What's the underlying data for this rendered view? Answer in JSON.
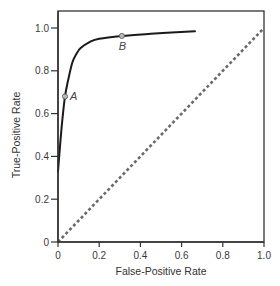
{
  "chart_data": {
    "type": "line",
    "title": "",
    "xlabel": "False-Positive Rate",
    "ylabel": "True-Positive Rate",
    "xlim": [
      0,
      1.0
    ],
    "ylim": [
      0,
      1.0
    ],
    "grid": false,
    "legend": "none",
    "x_ticks": [
      {
        "value": 0,
        "label": "0"
      },
      {
        "value": 0.2,
        "label": "0.2"
      },
      {
        "value": 0.4,
        "label": "0.4"
      },
      {
        "value": 0.6,
        "label": "0.6"
      },
      {
        "value": 0.8,
        "label": "0.8"
      },
      {
        "value": 1.0,
        "label": "1.0"
      }
    ],
    "y_ticks": [
      {
        "value": 0,
        "label": "0"
      },
      {
        "value": 0.2,
        "label": "0.2"
      },
      {
        "value": 0.4,
        "label": "0.4"
      },
      {
        "value": 0.6,
        "label": "0.6"
      },
      {
        "value": 0.8,
        "label": "0.8"
      },
      {
        "value": 1.0,
        "label": "1.0"
      }
    ],
    "series": [
      {
        "name": "ROC curve",
        "style": "solid",
        "color": "#1a1a1a",
        "x": [
          0.0,
          0.01,
          0.02,
          0.034,
          0.05,
          0.07,
          0.09,
          0.11,
          0.155,
          0.2,
          0.31,
          0.45,
          0.55,
          0.665
        ],
        "y": [
          0.33,
          0.45,
          0.56,
          0.68,
          0.76,
          0.84,
          0.88,
          0.906,
          0.935,
          0.95,
          0.963,
          0.973,
          0.979,
          0.985
        ]
      },
      {
        "name": "Chance line",
        "style": "dotted",
        "color": "#6b6b6b",
        "x": [
          0,
          1.0
        ],
        "y": [
          0,
          1.0
        ]
      }
    ],
    "annotations": [
      {
        "label": "A",
        "x": 0.034,
        "y": 0.68,
        "label_position": "right"
      },
      {
        "label": "B",
        "x": 0.31,
        "y": 0.963,
        "label_position": "below"
      }
    ]
  }
}
